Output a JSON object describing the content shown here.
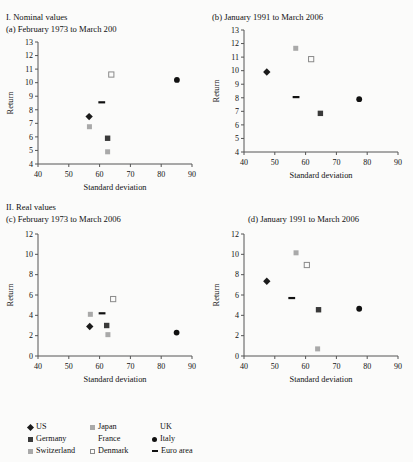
{
  "figure": {
    "sections": [
      {
        "id": "nominal",
        "label": "I. Nominal values"
      },
      {
        "id": "real",
        "label": "II. Real values"
      }
    ],
    "axis_titles": {
      "x": "Standard deviation",
      "y": "Return"
    }
  },
  "legend": {
    "entries": [
      {
        "name": "US",
        "marker": "diamond",
        "color": "#1b1b1b"
      },
      {
        "name": "Japan",
        "marker": "square-light",
        "color": "#a9a9a9"
      },
      {
        "name": "UK",
        "marker": "none",
        "color": "#a9a9a9"
      },
      {
        "name": "Germany",
        "marker": "square-dark",
        "color": "#3a3a3a"
      },
      {
        "name": "France",
        "marker": "none",
        "color": "#a9a9a9"
      },
      {
        "name": "Italy",
        "marker": "circle",
        "color": "#111111"
      },
      {
        "name": "Switzerland",
        "marker": "square-light",
        "color": "#a9a9a9"
      },
      {
        "name": "Denmark",
        "marker": "square-open",
        "color": "#8a8a8a"
      },
      {
        "name": "Euro area",
        "marker": "dash",
        "color": "#111111"
      }
    ]
  },
  "chart_data": [
    {
      "id": "a",
      "type": "scatter",
      "title": "(a) February 1973 to March 200",
      "xlabel": "Standard deviation",
      "ylabel": "Return",
      "xlim": [
        40,
        90
      ],
      "ylim": [
        4,
        13
      ],
      "xticks": [
        40,
        50,
        60,
        70,
        80,
        90
      ],
      "yticks": [
        4,
        5,
        6,
        7,
        8,
        9,
        10,
        11,
        12,
        13
      ],
      "grid": false,
      "points": [
        {
          "name": "US",
          "x": 56.6,
          "y": 7.5,
          "marker": "diamond"
        },
        {
          "name": "Japan",
          "x": 56.7,
          "y": 6.75,
          "marker": "square-light"
        },
        {
          "name": "Germany",
          "x": 62.6,
          "y": 5.9,
          "marker": "square-dark"
        },
        {
          "name": "Switzerland",
          "x": 62.6,
          "y": 4.9,
          "marker": "square-light"
        },
        {
          "name": "Denmark",
          "x": 63.8,
          "y": 10.6,
          "marker": "square-open"
        },
        {
          "name": "Italy",
          "x": 85.1,
          "y": 10.2,
          "marker": "circle"
        },
        {
          "name": "Euro area",
          "x": 60.7,
          "y": 8.55,
          "marker": "dash"
        }
      ]
    },
    {
      "id": "b",
      "type": "scatter",
      "title": "(b) January 1991 to March 2006",
      "xlabel": "Standard deviation",
      "ylabel": "Return",
      "xlim": [
        40,
        90
      ],
      "ylim": [
        4,
        13
      ],
      "xticks": [
        40,
        50,
        60,
        70,
        80,
        90
      ],
      "yticks": [
        4,
        5,
        6,
        7,
        8,
        9,
        10,
        11,
        12,
        13
      ],
      "grid": false,
      "points": [
        {
          "name": "US",
          "x": 47.4,
          "y": 9.9,
          "marker": "diamond"
        },
        {
          "name": "Japan",
          "x": 56.8,
          "y": 11.65,
          "marker": "square-light"
        },
        {
          "name": "Denmark",
          "x": 61.8,
          "y": 10.85,
          "marker": "square-open"
        },
        {
          "name": "Germany",
          "x": 64.8,
          "y": 6.85,
          "marker": "square-dark"
        },
        {
          "name": "Italy",
          "x": 77.4,
          "y": 7.9,
          "marker": "circle"
        },
        {
          "name": "Euro area",
          "x": 56.9,
          "y": 8.05,
          "marker": "dash"
        }
      ]
    },
    {
      "id": "c",
      "type": "scatter",
      "title": "(c) February 1973 to March 2006",
      "xlabel": "Standard deviation",
      "ylabel": "Return",
      "xlim": [
        40,
        90
      ],
      "ylim": [
        0,
        12
      ],
      "xticks": [
        40,
        50,
        60,
        70,
        80,
        90
      ],
      "yticks": [
        0,
        2,
        4,
        6,
        8,
        10,
        12
      ],
      "grid": false,
      "points": [
        {
          "name": "US",
          "x": 56.8,
          "y": 2.9,
          "marker": "diamond"
        },
        {
          "name": "Japan",
          "x": 57.0,
          "y": 4.1,
          "marker": "square-light"
        },
        {
          "name": "Germany",
          "x": 62.3,
          "y": 3.0,
          "marker": "square-dark"
        },
        {
          "name": "Switzerland",
          "x": 62.7,
          "y": 2.1,
          "marker": "square-light"
        },
        {
          "name": "Denmark",
          "x": 64.4,
          "y": 5.6,
          "marker": "square-open"
        },
        {
          "name": "Italy",
          "x": 85.0,
          "y": 2.3,
          "marker": "circle"
        },
        {
          "name": "Euro area",
          "x": 60.8,
          "y": 4.2,
          "marker": "dash"
        }
      ]
    },
    {
      "id": "d",
      "type": "scatter",
      "title": "(d) January 1991 to March 2006",
      "xlabel": "Standard deviation",
      "ylabel": "Return",
      "xlim": [
        40,
        90
      ],
      "ylim": [
        0,
        12
      ],
      "xticks": [
        40,
        50,
        60,
        70,
        80,
        90
      ],
      "yticks": [
        0,
        2,
        4,
        6,
        8,
        10,
        12
      ],
      "grid": false,
      "points": [
        {
          "name": "US",
          "x": 47.4,
          "y": 7.35,
          "marker": "diamond"
        },
        {
          "name": "Japan",
          "x": 56.9,
          "y": 10.15,
          "marker": "square-light"
        },
        {
          "name": "Denmark",
          "x": 60.4,
          "y": 8.95,
          "marker": "square-open"
        },
        {
          "name": "Germany",
          "x": 64.2,
          "y": 4.55,
          "marker": "square-dark"
        },
        {
          "name": "Switzerland",
          "x": 63.9,
          "y": 0.7,
          "marker": "square-light"
        },
        {
          "name": "Italy",
          "x": 77.4,
          "y": 4.65,
          "marker": "circle"
        },
        {
          "name": "Euro area",
          "x": 55.5,
          "y": 5.7,
          "marker": "dash"
        }
      ]
    }
  ]
}
